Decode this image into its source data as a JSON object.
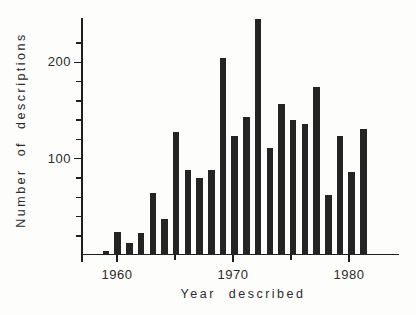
{
  "figure": {
    "background_color": "#fdfdfb",
    "bar_color": "#242424",
    "axis_color": "#1e1e1e",
    "text_color": "#2b2b2b"
  },
  "chart_data": {
    "type": "bar",
    "title": "",
    "xlabel": "Year described",
    "ylabel": "Number of descriptions",
    "categories": [
      "1959",
      "1960",
      "1961",
      "1962",
      "1963",
      "1964",
      "1965",
      "1966",
      "1967",
      "1968",
      "1969",
      "1970",
      "1971",
      "1972",
      "1973",
      "1974",
      "1975",
      "1976",
      "1977",
      "1978",
      "1979",
      "1980",
      "1981"
    ],
    "values": [
      4,
      24,
      12,
      23,
      64,
      37,
      128,
      88,
      80,
      88,
      205,
      124,
      143,
      245,
      111,
      157,
      140,
      136,
      174,
      62,
      124,
      86,
      131
    ],
    "ylim": [
      0,
      245
    ],
    "yticks_major": [
      100,
      200
    ],
    "yticks_minor": [
      20,
      40,
      60,
      80,
      120,
      140,
      160,
      180,
      220
    ],
    "xticks_major": [
      "1960",
      "1970",
      "1980"
    ],
    "xticks_minor": [
      "1965",
      "1975"
    ],
    "grid": false,
    "legend": "none"
  }
}
